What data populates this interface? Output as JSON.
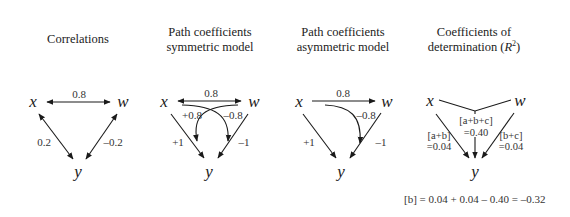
{
  "panels": [
    {
      "title_lines": [
        "Correlations"
      ],
      "nodes": {
        "x": "x",
        "w": "w",
        "y": "y"
      },
      "edges": {
        "xw": "0.8",
        "xy": "0.2",
        "wy": "–0.2"
      }
    },
    {
      "title_lines": [
        "Path coefficients",
        "symmetric model"
      ],
      "nodes": {
        "x": "x",
        "w": "w",
        "y": "y"
      },
      "edges": {
        "xw": "0.8",
        "xy": "+1",
        "wy": "–1",
        "x_via_w": "+0.8",
        "w_via_x": "–0.8"
      }
    },
    {
      "title_lines": [
        "Path coefficients",
        "asymmetric model"
      ],
      "nodes": {
        "x": "x",
        "w": "w",
        "y": "y"
      },
      "edges": {
        "xw": "0.8",
        "xy": "+1",
        "wy": "–1",
        "x_via_w": "–0.8"
      }
    },
    {
      "title_lines": [
        "Coefficients of",
        "determination ("
      ],
      "title_r": "R",
      "title_sup": "2",
      "title_close": ")",
      "nodes": {
        "x": "x",
        "w": "w",
        "y": "y"
      },
      "edges": {
        "xy_name": "[a+b]",
        "xy_val": "=0.04",
        "joint_name": "[a+b+c]",
        "joint_val": "=0.40",
        "wy_name": "[b+c]",
        "wy_val": "=0.04"
      }
    }
  ],
  "formula": "[b] = 0.04 + 0.04 – 0.40 = –0.32"
}
